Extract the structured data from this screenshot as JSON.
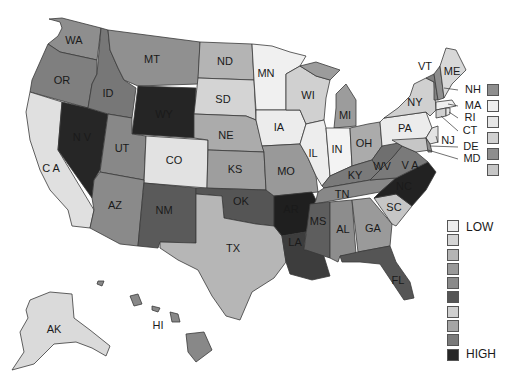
{
  "map": {
    "title": "",
    "colors": {
      "c1": "#efefef",
      "c2": "#d9d9d9",
      "c3": "#c6c6c6",
      "c4": "#a9a9a9",
      "c5": "#8e8e8e",
      "c6": "#777777",
      "c7": "#5f5f5f",
      "c8": "#3a3a3a",
      "c9": "#2a2a2a",
      "c10": "#1e1e1e"
    },
    "states": {
      "WA": "WA",
      "OR": "OR",
      "CA": "C A",
      "NV": "N V",
      "ID": "ID",
      "MT": "MT",
      "WY": "WY",
      "UT": "UT",
      "AZ": "AZ",
      "CO": "CO",
      "NM": "NM",
      "ND": "ND",
      "SD": "SD",
      "NE": "NE",
      "KS": "KS",
      "OK": "OK",
      "TX": "TX",
      "MN": "MN",
      "IA": "IA",
      "MO": "MO",
      "AR": "AR",
      "LA": "LA",
      "WI": "WI",
      "IL": "IL",
      "MI": "MI",
      "IN": "IN",
      "OH": "OH",
      "KY": "KY",
      "TN": "TN",
      "MS": "MS",
      "AL": "AL",
      "GA": "GA",
      "FL": "FL",
      "SC": "SC",
      "NC": "NC",
      "VA": "V A",
      "WV": "WV",
      "PA": "PA",
      "NY": "NY",
      "VT": "VT",
      "ME": "ME",
      "AK": "AK",
      "HI": "HI"
    },
    "northeast_callouts": [
      {
        "abbr": "NH",
        "shade": "#8e8e8e"
      },
      {
        "abbr": "MA",
        "shade": "#efefef"
      },
      {
        "abbr": "RI",
        "shade": "#e6e6e6"
      },
      {
        "abbr": "CT",
        "shade": "#d0d0d0"
      },
      {
        "abbr": "DE",
        "shade": "#8e8e8e"
      },
      {
        "abbr": "MD",
        "shade": "#c6c6c6"
      }
    ],
    "other_callouts": [
      {
        "abbr": "NJ"
      }
    ],
    "legend": {
      "low_label": "LOW",
      "high_label": "HIGH",
      "swatches": [
        "#ececec",
        "#d4d4d4",
        "#b4b4b4",
        "#999999",
        "#8a8a8a",
        "#555555",
        "#cfcfcf",
        "#a5a5a5",
        "#7a7a7a",
        "#262626"
      ]
    }
  }
}
